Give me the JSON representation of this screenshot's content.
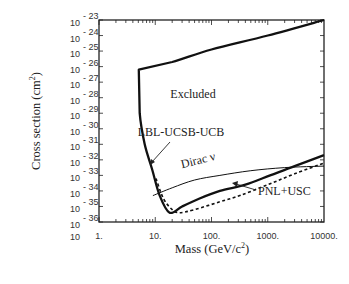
{
  "chart_data": {
    "type": "line",
    "title": "",
    "xlabel": "Mass (GeV/c²)",
    "xlabel_base": "Mass (GeV/c",
    "xlabel_sup": "2",
    "xlabel_end": ")",
    "ylabel": "Cross section (cm²)",
    "ylabel_base": "Cross section (cm",
    "ylabel_sup": "2",
    "ylabel_end": ")",
    "xscale": "log",
    "yscale": "log",
    "xlim": [
      1,
      10000
    ],
    "ylim": [
      1e-36,
      1e-23
    ],
    "grid": false,
    "legend": "none (inline annotations)",
    "x_tick_labels": [
      "1.",
      "10.",
      "100.",
      "1000.",
      "10000."
    ],
    "y_tick_exponents": [
      "-23",
      "-24",
      "-25",
      "-26",
      "-27",
      "-28",
      "-29",
      "-30",
      "-31",
      "-32",
      "-33",
      "-34",
      "-35",
      "-36"
    ],
    "y_tick_base": "10",
    "series": [
      {
        "name": "LBL-UCSB-UCB",
        "style": "solid-thick",
        "description": "Exclusion boundary; region above/inside is excluded",
        "x": [
          10000,
          1000,
          100,
          20,
          5.1,
          5.3,
          6.5,
          8.8,
          12,
          18,
          30,
          60,
          141,
          400,
          1100,
          3000,
          10000
        ],
        "log10_y": [
          -23.0,
          -24.0,
          -24.9,
          -25.7,
          -26.2,
          -29.0,
          -31.0,
          -32.6,
          -34.3,
          -35.4,
          -35.0,
          -34.5,
          -34.0,
          -33.6,
          -33.0,
          -32.4,
          -31.7
        ]
      },
      {
        "name": "Dirac ν",
        "style": "solid-thin",
        "x": [
          9.1,
          20,
          50,
          141,
          500,
          2000,
          10000
        ],
        "log10_y": [
          -34.3,
          -33.8,
          -33.3,
          -33.0,
          -32.7,
          -32.5,
          -32.4
        ]
      },
      {
        "name": "PNL+USC",
        "style": "dashed",
        "x": [
          10.3,
          14,
          20,
          27,
          50,
          141,
          320,
          1000,
          3000,
          10000
        ],
        "log10_y": [
          -33.2,
          -34.5,
          -35.2,
          -35.4,
          -35.2,
          -34.7,
          -34.3,
          -33.6,
          -32.9,
          -32.2
        ]
      }
    ],
    "annotations": [
      {
        "text": "Excluded",
        "position": "inside excluded region"
      },
      {
        "text": "LBL-UCSB-UCB",
        "arrow_to": "solid exclusion curve near 8 GeV"
      },
      {
        "text": "Dirac ν",
        "position": "along Dirac curve"
      },
      {
        "text": "PNL+USC",
        "arrow_to": "dashed curve near 400 GeV"
      }
    ]
  },
  "labels": {
    "excluded": "Excluded",
    "lbl": "LBL-UCSB-UCB",
    "dirac": "Dirac ν",
    "pnl": "PNL+USC"
  }
}
